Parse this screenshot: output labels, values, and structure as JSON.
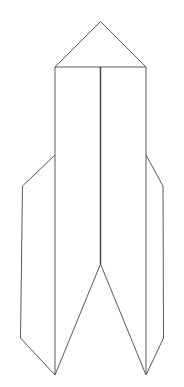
{
  "document": {
    "title": "Rocket Line Drawing",
    "subject": "rocket",
    "style": "black-and-white line art outline",
    "background_color": "#ffffff",
    "canvas": {
      "width": 184,
      "height": 387
    }
  },
  "drawing": {
    "stroke_color": "#595959",
    "seam_stroke_color": "#3a3a3a",
    "stroke_width": 1,
    "seam_stroke_width": 1.4,
    "parts": [
      {
        "name": "nose-cone",
        "label": "Nose cone",
        "type": "polyline",
        "closed": false,
        "points": "55,67 100.5,21.5 146,67"
      },
      {
        "name": "body-left-edge",
        "label": "Body left edge",
        "type": "polyline",
        "closed": false,
        "points": "55,67 55,375"
      },
      {
        "name": "body-right-edge",
        "label": "Body right edge",
        "type": "polyline",
        "closed": false,
        "points": "146,67 146,375"
      },
      {
        "name": "shoulder-line",
        "label": "Nose cone base line",
        "type": "polyline",
        "closed": false,
        "points": "55,67 146,67"
      },
      {
        "name": "center-seam",
        "label": "Body center seam",
        "type": "polyline",
        "closed": false,
        "points": "100.5,67 100.5,264"
      },
      {
        "name": "center-notch",
        "label": "Bottom center V notch",
        "type": "polyline",
        "closed": false,
        "points": "55,375 100.5,264 146,375"
      },
      {
        "name": "left-fin",
        "label": "Left fin",
        "type": "polyline",
        "closed": false,
        "points": "55,155 22.5,186 20.5,338 55,375"
      },
      {
        "name": "right-fin",
        "label": "Right fin",
        "type": "polyline",
        "closed": false,
        "points": "146,155 163,186 163.5,338 146,375"
      }
    ]
  }
}
